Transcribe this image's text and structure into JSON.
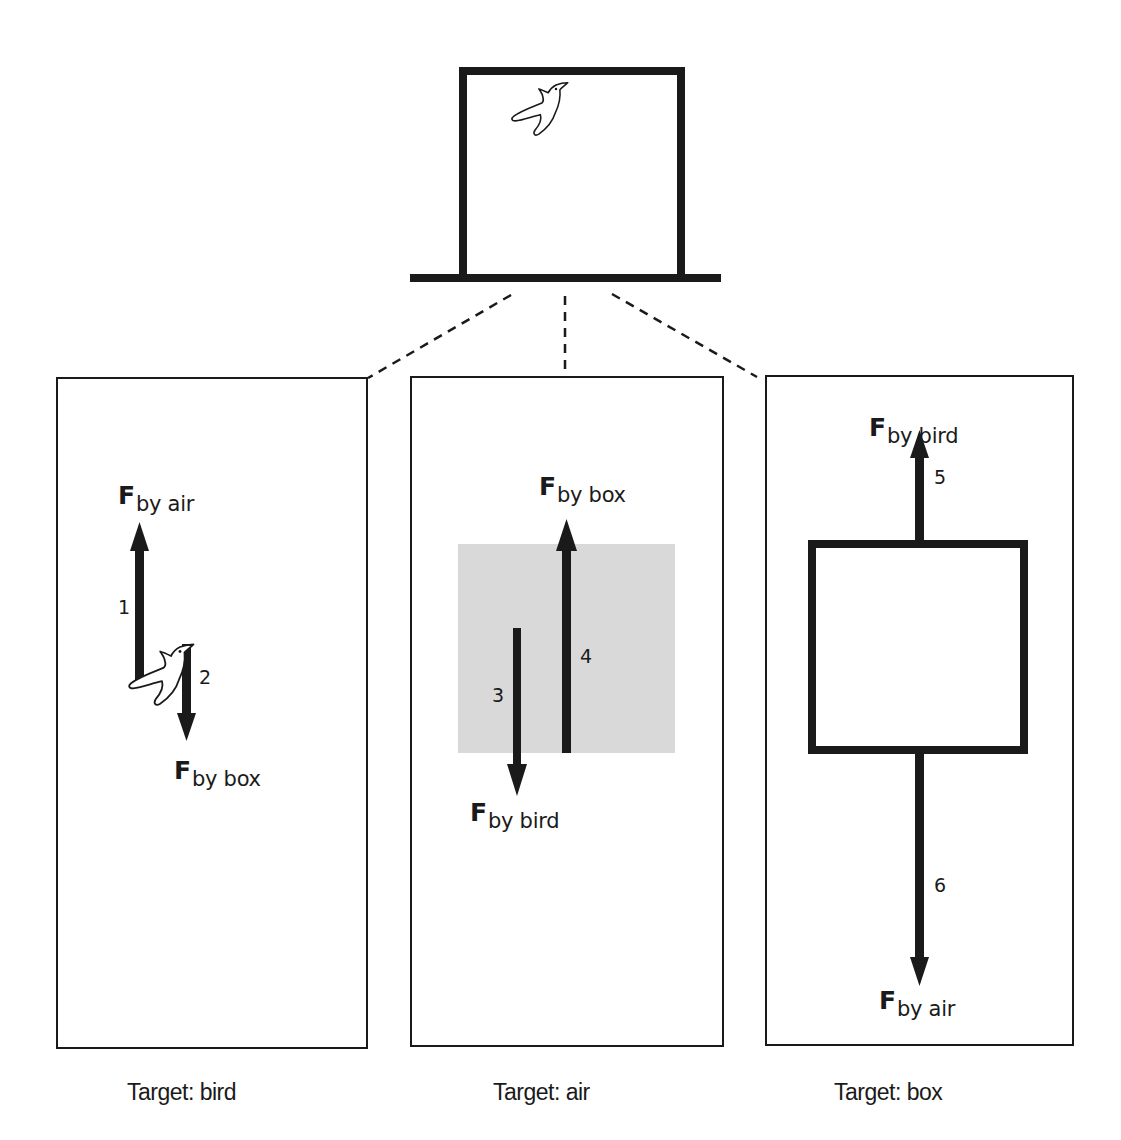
{
  "diagram": {
    "type": "free-body interaction diagram",
    "scene": {
      "description": "Bird inside a closed box resting on a surface",
      "objects": [
        "box",
        "bird",
        "air",
        "ground"
      ]
    },
    "panels": [
      {
        "target": "bird",
        "caption": "Target: bird",
        "forces": [
          {
            "id": "1",
            "symbol": "F",
            "subscript": "by air",
            "direction": "up"
          },
          {
            "id": "2",
            "symbol": "F",
            "subscript": "by box",
            "direction": "down"
          }
        ]
      },
      {
        "target": "air",
        "caption": "Target: air",
        "forces": [
          {
            "id": "3",
            "symbol": "F",
            "subscript": "by bird",
            "direction": "down"
          },
          {
            "id": "4",
            "symbol": "F",
            "subscript": "by box",
            "direction": "up"
          }
        ]
      },
      {
        "target": "box",
        "caption": "Target: box",
        "forces": [
          {
            "id": "5",
            "symbol": "F",
            "subscript": "by bird",
            "direction": "up"
          },
          {
            "id": "6",
            "symbol": "F",
            "subscript": "by air",
            "direction": "down"
          }
        ]
      }
    ],
    "colors": {
      "ink": "#1a1a1a",
      "air_region": "#d9d9d9",
      "background": "#ffffff"
    }
  }
}
